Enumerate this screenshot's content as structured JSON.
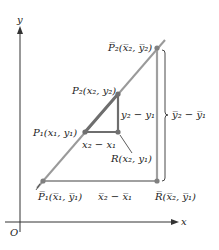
{
  "diagram": {
    "colors": {
      "background": "#ffffff",
      "axis": "#333333",
      "line": "#9a9a9a",
      "small_triangle": "#6e6e6e",
      "big_triangle": "#a0a0a0",
      "point": "#707070",
      "text": "#222222"
    },
    "axes": {
      "x_label": "x",
      "y_label": "y",
      "origin_label": "O"
    },
    "points": {
      "P1": "P₁(x₁, y₁)",
      "P2": "P₂(x₂, y₂)",
      "R": "R(x₂, y₁)",
      "P1bar": "P̅₁(x̅₁, y̅₁)",
      "P2bar": "P̅₂(x̅₂, y̅₂)",
      "Rbar": "R̅(x̅₂, y̅₁)"
    },
    "differences": {
      "small_dx": "x₂ − x₁",
      "small_dy": "y₂ − y₁",
      "big_dx": "x̅₂ − x̅₁",
      "big_dy": "y̅₂ − y̅₁"
    }
  }
}
